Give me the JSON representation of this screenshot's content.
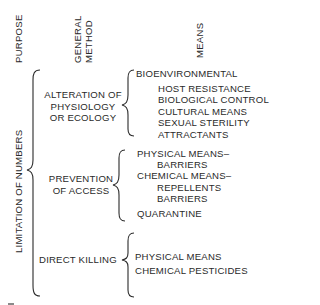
{
  "headers": {
    "purpose": "PURPOSE",
    "general_method_line1": "GENERAL",
    "general_method_line2": "METHOD",
    "means": "MEANS"
  },
  "purpose": {
    "label": "LIMITATION OF NUMBERS"
  },
  "methods": [
    {
      "lines": [
        "ALTERATION OF",
        "PHYSIOLOGY",
        "OR ECOLOGY"
      ],
      "means": [
        {
          "text": "BIOENVIRONMENTAL",
          "indent": 0
        },
        {
          "text": "HOST RESISTANCE",
          "indent": 1
        },
        {
          "text": "BIOLOGICAL CONTROL",
          "indent": 1
        },
        {
          "text": "CULTURAL MEANS",
          "indent": 1
        },
        {
          "text": "SEXUAL STERILITY",
          "indent": 1
        },
        {
          "text": "ATTRACTANTS",
          "indent": 1
        }
      ]
    },
    {
      "lines": [
        "PREVENTION",
        "OF ACCESS"
      ],
      "means": [
        {
          "text": "PHYSICAL MEANS–",
          "indent": 0
        },
        {
          "text": "BARRIERS",
          "indent": 2
        },
        {
          "text": "CHEMICAL MEANS–",
          "indent": 0
        },
        {
          "text": "REPELLENTS",
          "indent": 2
        },
        {
          "text": "BARRIERS",
          "indent": 2
        },
        {
          "text": "QUARANTINE",
          "indent": 0
        }
      ]
    },
    {
      "lines": [
        "DIRECT KILLING"
      ],
      "means": [
        {
          "text": "PHYSICAL MEANS",
          "indent": 0
        },
        {
          "text": "CHEMICAL PESTICIDES",
          "indent": 0
        }
      ]
    }
  ]
}
